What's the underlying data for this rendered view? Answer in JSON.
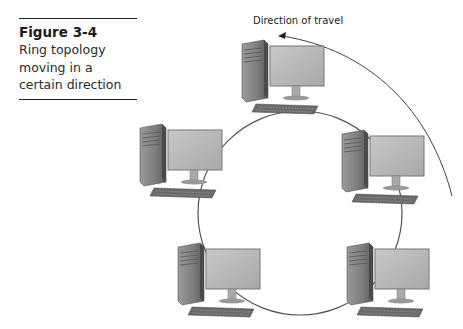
{
  "figure": {
    "number": "Figure 3-4",
    "caption_lines": [
      "Ring topology",
      "moving in a",
      "certain direction"
    ]
  },
  "diagram": {
    "type": "ring-topology",
    "direction_label": "Direction of travel",
    "direction": "counterclockwise",
    "ring": {
      "cx": 300,
      "cy": 213,
      "r": 102,
      "stroke": "#555555"
    },
    "nodes": [
      {
        "id": "pc-top",
        "label": "workstation",
        "x": 262,
        "y": 62
      },
      {
        "id": "pc-left",
        "label": "workstation",
        "x": 156,
        "y": 145
      },
      {
        "id": "pc-right",
        "label": "workstation",
        "x": 344,
        "y": 150
      },
      {
        "id": "pc-bottom-left",
        "label": "workstation",
        "x": 176,
        "y": 243
      },
      {
        "id": "pc-bottom-right",
        "label": "workstation",
        "x": 345,
        "y": 243
      }
    ],
    "colors": {
      "tower": "#8a8a8a",
      "monitor": "#b9b9b9",
      "keyboard": "#6a6a6a",
      "line": "#555555"
    }
  }
}
